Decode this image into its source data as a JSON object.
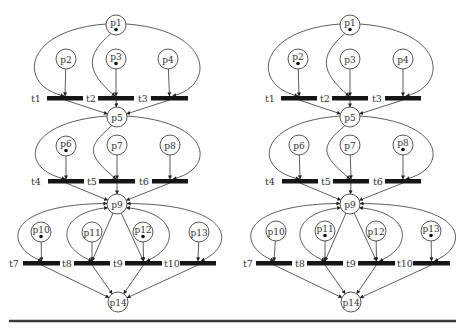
{
  "figure": {
    "width": 465,
    "height": 331,
    "colors": {
      "stroke": "#333333",
      "bar": "#151515",
      "token": "#111111",
      "rule": "#3a3a3a"
    },
    "place_radius": 10,
    "bottom_rule": {
      "x1": 9,
      "x2": 456,
      "y": 321
    }
  },
  "nets": [
    {
      "id": "left",
      "places": [
        {
          "id": "p1",
          "label": "p1",
          "x": 116,
          "y": 25,
          "token": true
        },
        {
          "id": "p2",
          "label": "p2",
          "x": 66,
          "y": 59,
          "token": false
        },
        {
          "id": "p3",
          "label": "p3",
          "x": 116,
          "y": 59,
          "token": true
        },
        {
          "id": "p4",
          "label": "p4",
          "x": 168,
          "y": 59,
          "token": false
        },
        {
          "id": "p5",
          "label": "p5",
          "x": 117,
          "y": 117,
          "token": false
        },
        {
          "id": "p6",
          "label": "p6",
          "x": 66,
          "y": 146,
          "token": true
        },
        {
          "id": "p7",
          "label": "p7",
          "x": 117,
          "y": 145,
          "token": false
        },
        {
          "id": "p8",
          "label": "p8",
          "x": 170,
          "y": 145,
          "token": false
        },
        {
          "id": "p9",
          "label": "p9",
          "x": 117,
          "y": 204,
          "token": false
        },
        {
          "id": "p10",
          "label": "p10",
          "x": 41,
          "y": 232,
          "token": true
        },
        {
          "id": "p11",
          "label": "p11",
          "x": 92,
          "y": 232,
          "token": false
        },
        {
          "id": "p12",
          "label": "p12",
          "x": 143,
          "y": 232,
          "token": true
        },
        {
          "id": "p13",
          "label": "p13",
          "x": 199,
          "y": 232,
          "token": false
        },
        {
          "id": "p14",
          "label": "p14",
          "x": 118,
          "y": 302,
          "token": false
        }
      ],
      "transitions": [
        {
          "id": "t1",
          "label": "t1",
          "x1": 47,
          "x2": 83,
          "y": 97,
          "lx": 31
        },
        {
          "id": "t2",
          "label": "t2",
          "x1": 98,
          "x2": 134,
          "y": 97,
          "lx": 86
        },
        {
          "id": "t3",
          "label": "t3",
          "x1": 151,
          "x2": 188,
          "y": 97,
          "lx": 138
        },
        {
          "id": "t4",
          "label": "t4",
          "x1": 48,
          "x2": 84,
          "y": 180,
          "lx": 31
        },
        {
          "id": "t5",
          "label": "t5",
          "x1": 99,
          "x2": 135,
          "y": 180,
          "lx": 87
        },
        {
          "id": "t6",
          "label": "t6",
          "x1": 152,
          "x2": 188,
          "y": 180,
          "lx": 139
        },
        {
          "id": "t7",
          "label": "t7",
          "x1": 23,
          "x2": 60,
          "y": 262,
          "lx": 9
        },
        {
          "id": "t8",
          "label": "t8",
          "x1": 74,
          "x2": 110,
          "y": 262,
          "lx": 62
        },
        {
          "id": "t9",
          "label": "t9",
          "x1": 125,
          "x2": 162,
          "y": 262,
          "lx": 113
        },
        {
          "id": "t10",
          "label": "t10",
          "x1": 180,
          "x2": 216,
          "y": 262,
          "lx": 164
        }
      ]
    },
    {
      "id": "right",
      "places": [
        {
          "id": "p1",
          "label": "p1",
          "x": 350,
          "y": 25,
          "token": true
        },
        {
          "id": "p2",
          "label": "p2",
          "x": 298,
          "y": 59,
          "token": true
        },
        {
          "id": "p3",
          "label": "p3",
          "x": 350,
          "y": 59,
          "token": false
        },
        {
          "id": "p4",
          "label": "p4",
          "x": 403,
          "y": 59,
          "token": false
        },
        {
          "id": "p5",
          "label": "p5",
          "x": 350,
          "y": 117,
          "token": false
        },
        {
          "id": "p6",
          "label": "p6",
          "x": 299,
          "y": 145,
          "token": false
        },
        {
          "id": "p7",
          "label": "p7",
          "x": 350,
          "y": 145,
          "token": false
        },
        {
          "id": "p8",
          "label": "p8",
          "x": 403,
          "y": 145,
          "token": true
        },
        {
          "id": "p9",
          "label": "p9",
          "x": 350,
          "y": 204,
          "token": false
        },
        {
          "id": "p10",
          "label": "p10",
          "x": 276,
          "y": 231,
          "token": false
        },
        {
          "id": "p11",
          "label": "p11",
          "x": 325,
          "y": 231,
          "token": true
        },
        {
          "id": "p12",
          "label": "p12",
          "x": 376,
          "y": 231,
          "token": false
        },
        {
          "id": "p13",
          "label": "p13",
          "x": 431,
          "y": 231,
          "token": true
        },
        {
          "id": "p14",
          "label": "p14",
          "x": 351,
          "y": 302,
          "token": false
        }
      ],
      "transitions": [
        {
          "id": "t1",
          "label": "t1",
          "x1": 281,
          "x2": 317,
          "y": 97,
          "lx": 265
        },
        {
          "id": "t2",
          "label": "t2",
          "x1": 332,
          "x2": 368,
          "y": 97,
          "lx": 320
        },
        {
          "id": "t3",
          "label": "t3",
          "x1": 385,
          "x2": 421,
          "y": 97,
          "lx": 372
        },
        {
          "id": "t4",
          "label": "t4",
          "x1": 282,
          "x2": 318,
          "y": 180,
          "lx": 265
        },
        {
          "id": "t5",
          "label": "t5",
          "x1": 333,
          "x2": 369,
          "y": 180,
          "lx": 321
        },
        {
          "id": "t6",
          "label": "t6",
          "x1": 385,
          "x2": 421,
          "y": 180,
          "lx": 373
        },
        {
          "id": "t7",
          "label": "t7",
          "x1": 256,
          "x2": 292,
          "y": 262,
          "lx": 243
        },
        {
          "id": "t8",
          "label": "t8",
          "x1": 307,
          "x2": 343,
          "y": 262,
          "lx": 295
        },
        {
          "id": "t9",
          "label": "t9",
          "x1": 358,
          "x2": 395,
          "y": 262,
          "lx": 346
        },
        {
          "id": "t10",
          "label": "t10",
          "x1": 413,
          "x2": 450,
          "y": 262,
          "lx": 397
        }
      ]
    }
  ],
  "arcs": {
    "straight_in": [
      [
        "p2",
        "t1"
      ],
      [
        "p3",
        "t2"
      ],
      [
        "p4",
        "t3"
      ],
      [
        "p6",
        "t4"
      ],
      [
        "p7",
        "t5"
      ],
      [
        "p8",
        "t6"
      ],
      [
        "p10",
        "t7"
      ],
      [
        "p11",
        "t8"
      ],
      [
        "p12",
        "t9"
      ],
      [
        "p13",
        "t10"
      ],
      [
        "p9",
        "t8"
      ],
      [
        "p9",
        "t9"
      ]
    ],
    "curved_from_top": [
      [
        "p1",
        "t1",
        "left"
      ],
      [
        "p1",
        "t2",
        "left"
      ],
      [
        "p1",
        "t3",
        "right"
      ],
      [
        "p5",
        "t4",
        "left"
      ],
      [
        "p5",
        "t5",
        "left"
      ],
      [
        "p5",
        "t6",
        "right"
      ]
    ],
    "to_merge": [
      [
        "t1",
        "p5"
      ],
      [
        "t2",
        "p5"
      ],
      [
        "t3",
        "p5"
      ],
      [
        "t4",
        "p9"
      ],
      [
        "t5",
        "p9"
      ],
      [
        "t6",
        "p9"
      ],
      [
        "t7",
        "p14"
      ],
      [
        "t8",
        "p14"
      ],
      [
        "t9",
        "p14"
      ],
      [
        "t10",
        "p14"
      ]
    ],
    "loops_p9": [
      [
        "t7",
        "outer-left"
      ],
      [
        "t8",
        "inner-left"
      ],
      [
        "t9",
        "inner-right"
      ],
      [
        "t10",
        "outer-right"
      ]
    ]
  }
}
